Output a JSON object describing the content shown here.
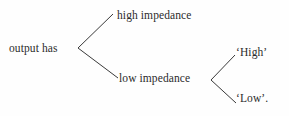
{
  "diagram": {
    "type": "tree",
    "background_color": "#fefefe",
    "line_color": "#3a3a3a",
    "text_color": "#2b2b2b",
    "nodes": {
      "root": "output has",
      "high_impedance": "high impedance",
      "low_impedance": "low impedance",
      "high_quoted": "‘High’",
      "low_quoted": "‘Low’."
    },
    "edges": [
      {
        "from": "root",
        "to": "high_impedance"
      },
      {
        "from": "root",
        "to": "low_impedance"
      },
      {
        "from": "low_impedance",
        "to": "high_quoted"
      },
      {
        "from": "low_impedance",
        "to": "low_quoted"
      }
    ]
  }
}
